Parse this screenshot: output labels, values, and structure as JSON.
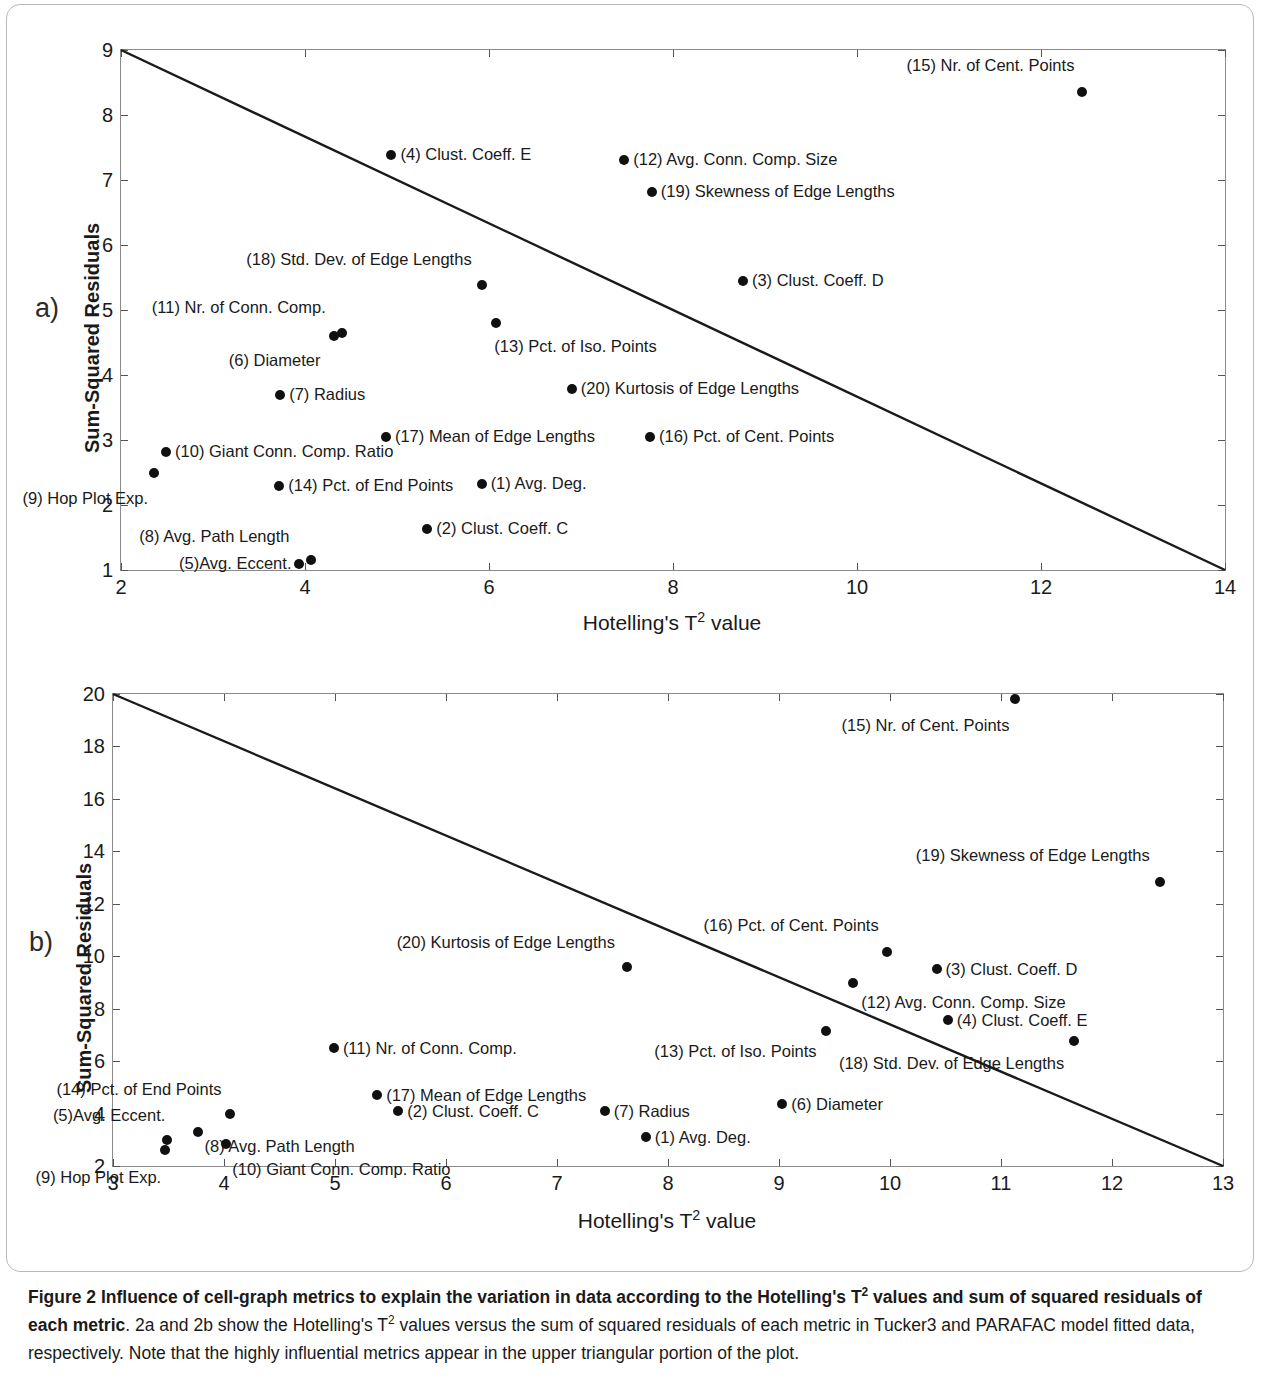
{
  "figure": {
    "panel_a_letter": "a)",
    "panel_b_letter": "b)",
    "caption_bold": "Figure 2 Influence of cell-graph metrics to explain the variation in data according to the Hotelling's T² values and sum of squared residuals of each metric",
    "caption_rest": ". 2a and 2b show the Hotelling's T² values versus the sum of squared residuals of each metric in Tucker3 and PARAFAC model fitted data, respectively. Note that the highly influential metrics appear in the upper triangular portion of the plot.",
    "caption_bold_part1": "Figure 2 Influence of cell-graph metrics to explain the variation in data according to the Hotelling's T",
    "caption_bold_part2": " values and sum of squared residuals of each metric",
    "caption_rest_part1": ". 2a and 2b show the Hotelling's T",
    "caption_rest_part2": " values versus the sum of squared residuals of each metric in Tucker3 and PARAFAC model fitted data, respectively. Note that the highly influential metrics appear in the upper triangular portion of the plot.",
    "sup": "2"
  },
  "chart_data": [
    {
      "id": "a",
      "type": "scatter",
      "title": "",
      "xlabel_prefix": "Hotelling's T",
      "xlabel_sup": "2",
      "xlabel_suffix": " value",
      "ylabel": "Sum-Squared Residuals",
      "xlim": [
        2,
        14
      ],
      "ylim": [
        1,
        9
      ],
      "xticks": [
        2,
        4,
        6,
        8,
        10,
        12,
        14
      ],
      "xticklabels": [
        "2",
        "4",
        "6",
        "8",
        "10",
        "12",
        "14"
      ],
      "yticks": [
        1,
        2,
        3,
        4,
        5,
        6,
        7,
        8,
        9
      ],
      "yticklabels": [
        "1",
        "2",
        "3",
        "4",
        "5",
        "6",
        "7",
        "8",
        "9"
      ],
      "grid": false,
      "reference_line": {
        "x1": 2,
        "y1": 9,
        "x2": 14,
        "y2": 1
      },
      "points": [
        {
          "n": 1,
          "label": "(1) Avg. Deg.",
          "x": 5.92,
          "y": 2.32,
          "side": "right"
        },
        {
          "n": 2,
          "label": "(2) Clust. Coeff. C",
          "x": 5.33,
          "y": 1.63,
          "side": "right"
        },
        {
          "n": 3,
          "label": "(3) Clust. Coeff. D",
          "x": 8.76,
          "y": 5.44,
          "side": "right"
        },
        {
          "n": 4,
          "label": "(4) Clust. Coeff. E",
          "x": 4.94,
          "y": 7.38,
          "side": "right"
        },
        {
          "n": 5,
          "label": "(5)Avg. Eccent.",
          "x": 3.94,
          "y": 1.09,
          "side": "left"
        },
        {
          "n": 6,
          "label": "(6) Diameter",
          "x": 4.32,
          "y": 4.6,
          "side": "below-left"
        },
        {
          "n": 7,
          "label": "(7) Radius",
          "x": 3.73,
          "y": 3.7,
          "side": "right"
        },
        {
          "n": 8,
          "label": "(8) Avg. Path Length",
          "x": 4.07,
          "y": 1.15,
          "side": "above-right"
        },
        {
          "n": 9,
          "label": "(9) Hop Plot Exp.",
          "x": 2.36,
          "y": 2.5,
          "side": "below"
        },
        {
          "n": 10,
          "label": "(10) Giant Conn. Comp. Ratio",
          "x": 2.49,
          "y": 2.81,
          "side": "right"
        },
        {
          "n": 11,
          "label": "(11) Nr. of Conn. Comp.",
          "x": 4.4,
          "y": 4.64,
          "side": "above-left"
        },
        {
          "n": 12,
          "label": "(12) Avg. Conn. Comp. Size",
          "x": 7.47,
          "y": 7.31,
          "side": "right"
        },
        {
          "n": 13,
          "label": "(13) Pct. of Iso. Points",
          "x": 6.08,
          "y": 4.8,
          "side": "below-right"
        },
        {
          "n": 14,
          "label": "(14) Pct. of End Points",
          "x": 3.72,
          "y": 2.29,
          "side": "right"
        },
        {
          "n": 15,
          "label": "(15) Nr. of Cent. Points",
          "x": 12.45,
          "y": 8.35,
          "side": "above"
        },
        {
          "n": 16,
          "label": "(16) Pct. of Cent. Points",
          "x": 7.75,
          "y": 3.05,
          "side": "right"
        },
        {
          "n": 17,
          "label": "(17) Mean of Edge Lengths",
          "x": 4.88,
          "y": 3.04,
          "side": "right"
        },
        {
          "n": 18,
          "label": "(18) Std. Dev. of Edge Lengths",
          "x": 5.92,
          "y": 5.38,
          "side": "above-left"
        },
        {
          "n": 19,
          "label": "(19) Skewness of Edge Lengths",
          "x": 7.77,
          "y": 6.82,
          "side": "right"
        },
        {
          "n": 20,
          "label": "(20) Kurtosis of Edge Lengths",
          "x": 6.9,
          "y": 3.78,
          "side": "right"
        }
      ]
    },
    {
      "id": "b",
      "type": "scatter",
      "title": "",
      "xlabel_prefix": "Hotelling's T",
      "xlabel_sup": "2",
      "xlabel_suffix": " value",
      "ylabel": "Sum-Squared Residuals",
      "xlim": [
        3,
        13
      ],
      "ylim": [
        2,
        20
      ],
      "xticks": [
        3,
        4,
        5,
        6,
        7,
        8,
        9,
        10,
        11,
        12,
        13
      ],
      "xticklabels": [
        "3",
        "4",
        "5",
        "6",
        "7",
        "8",
        "9",
        "10",
        "11",
        "12",
        "13"
      ],
      "yticks": [
        2,
        4,
        6,
        8,
        10,
        12,
        14,
        16,
        18,
        20
      ],
      "yticklabels": [
        "2",
        "4",
        "6",
        "8",
        "10",
        "12",
        "14",
        "16",
        "18",
        "20"
      ],
      "grid": false,
      "reference_line": {
        "x1": 3,
        "y1": 20,
        "x2": 13,
        "y2": 2
      },
      "points": [
        {
          "n": 1,
          "label": "(1) Avg. Deg.",
          "x": 7.8,
          "y": 3.1,
          "side": "right"
        },
        {
          "n": 2,
          "label": "(2) Clust. Coeff. C",
          "x": 5.57,
          "y": 4.1,
          "side": "right"
        },
        {
          "n": 3,
          "label": "(3) Clust. Coeff. D",
          "x": 10.42,
          "y": 9.52,
          "side": "right"
        },
        {
          "n": 4,
          "label": "(4) Clust. Coeff. E",
          "x": 10.52,
          "y": 7.56,
          "side": "right"
        },
        {
          "n": 5,
          "label": "(5)Avg. Eccent.",
          "x": 3.49,
          "y": 3.0,
          "side": "above-left"
        },
        {
          "n": 6,
          "label": "(6) Diameter",
          "x": 9.03,
          "y": 4.38,
          "side": "right"
        },
        {
          "n": 7,
          "label": "(7) Radius",
          "x": 7.43,
          "y": 4.08,
          "side": "right"
        },
        {
          "n": 8,
          "label": "(8) Avg. Path Length",
          "x": 3.77,
          "y": 3.28,
          "side": "right"
        },
        {
          "n": 9,
          "label": "(9) Hop Plot Exp.",
          "x": 3.47,
          "y": 2.6,
          "side": "below-right"
        },
        {
          "n": 10,
          "label": "(10) Giant Conn. Comp. Ratio",
          "x": 4.02,
          "y": 2.83,
          "side": "below-right"
        },
        {
          "n": 11,
          "label": "(11) Nr. of Conn. Comp.",
          "x": 4.99,
          "y": 6.5,
          "side": "right"
        },
        {
          "n": 12,
          "label": "(12) Avg. Conn. Comp. Size",
          "x": 9.67,
          "y": 8.96,
          "side": "below-right"
        },
        {
          "n": 13,
          "label": "(13) Pct. of Iso. Points",
          "x": 9.42,
          "y": 7.16,
          "side": "below-left"
        },
        {
          "n": 14,
          "label": "(14) Pct. of End Points",
          "x": 4.05,
          "y": 4.0,
          "side": "above-left"
        },
        {
          "n": 15,
          "label": "(15) Nr. of Cent. Points",
          "x": 11.13,
          "y": 19.8,
          "side": "below-left"
        },
        {
          "n": 16,
          "label": "(16) Pct. of Cent. Points",
          "x": 9.97,
          "y": 10.18,
          "side": "above-left"
        },
        {
          "n": 17,
          "label": "(17) Mean of Edge Lengths",
          "x": 5.38,
          "y": 4.72,
          "side": "right"
        },
        {
          "n": 18,
          "label": "(18) Std. Dev. of Edge Lengths",
          "x": 11.66,
          "y": 6.78,
          "side": "below-left"
        },
        {
          "n": 19,
          "label": "(19) Skewness of Edge Lengths",
          "x": 12.43,
          "y": 12.82,
          "side": "above-left"
        },
        {
          "n": 20,
          "label": "(20) Kurtosis of Edge Lengths",
          "x": 7.63,
          "y": 9.58,
          "side": "above-left"
        }
      ]
    }
  ]
}
